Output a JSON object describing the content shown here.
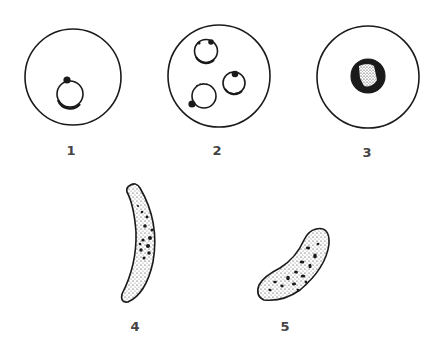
{
  "figure": {
    "panels": [
      {
        "id": "1",
        "label": "1",
        "description": "erythrocyte with single ring form, chromatin dot"
      },
      {
        "id": "2",
        "label": "2",
        "description": "erythrocyte with three ring forms"
      },
      {
        "id": "3",
        "label": "3",
        "description": "erythrocyte with stippled pigmented trophozoite"
      },
      {
        "id": "4",
        "label": "4",
        "description": "crescent-shaped gametocyte"
      },
      {
        "id": "5",
        "label": "5",
        "description": "sausage-shaped gametocyte with pigment granules"
      }
    ],
    "colors": {
      "ink": "#1a1a1a",
      "background": "#ffffff",
      "label": "#444444"
    }
  }
}
